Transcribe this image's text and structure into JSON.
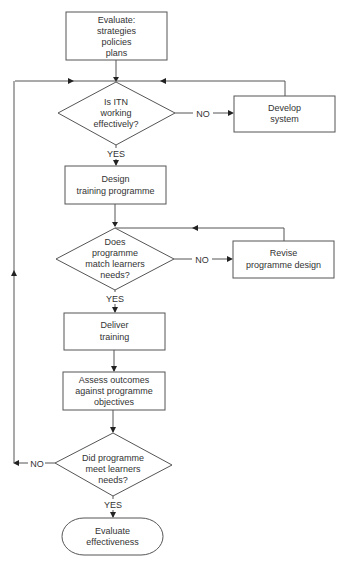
{
  "diagram": {
    "type": "flowchart",
    "colors": {
      "stroke": "#555555",
      "text": "#333333",
      "background": "#ffffff",
      "arrow": "#222222"
    },
    "nodes": {
      "evaluate_strategies": {
        "shape": "rectangle",
        "lines": [
          "Evaluate:",
          "strategies",
          "policies",
          "plans"
        ]
      },
      "itn_decision": {
        "shape": "diamond",
        "lines": [
          "Is ITN",
          "working",
          "effectively?"
        ]
      },
      "develop_system": {
        "shape": "rectangle",
        "lines": [
          "Develop",
          "system"
        ]
      },
      "design_training": {
        "shape": "rectangle",
        "lines": [
          "Design",
          "training programme"
        ]
      },
      "match_decision": {
        "shape": "diamond",
        "lines": [
          "Does",
          "programme",
          "match learners",
          "needs?"
        ]
      },
      "revise_design": {
        "shape": "rectangle",
        "lines": [
          "Revise",
          "programme design"
        ]
      },
      "deliver_training": {
        "shape": "rectangle",
        "lines": [
          "Deliver",
          "training"
        ]
      },
      "assess_outcomes": {
        "shape": "rectangle",
        "lines": [
          "Assess outcomes",
          "against programme",
          "objectives"
        ]
      },
      "meet_decision": {
        "shape": "diamond",
        "lines": [
          "Did programme",
          "meet learners",
          "needs?"
        ]
      },
      "evaluate_effectiveness": {
        "shape": "terminator",
        "lines": [
          "Evaluate",
          "effectiveness"
        ]
      }
    },
    "edges": [
      {
        "from": "evaluate_strategies",
        "to": "itn_decision",
        "label": ""
      },
      {
        "from": "itn_decision",
        "to": "develop_system",
        "label": "NO"
      },
      {
        "from": "develop_system",
        "to": "itn_decision",
        "label": ""
      },
      {
        "from": "itn_decision",
        "to": "design_training",
        "label": "YES"
      },
      {
        "from": "design_training",
        "to": "match_decision",
        "label": ""
      },
      {
        "from": "match_decision",
        "to": "revise_design",
        "label": "NO"
      },
      {
        "from": "revise_design",
        "to": "match_decision",
        "label": ""
      },
      {
        "from": "match_decision",
        "to": "deliver_training",
        "label": "YES"
      },
      {
        "from": "deliver_training",
        "to": "assess_outcomes",
        "label": ""
      },
      {
        "from": "assess_outcomes",
        "to": "meet_decision",
        "label": ""
      },
      {
        "from": "meet_decision",
        "to": "itn_decision",
        "label": "NO"
      },
      {
        "from": "meet_decision",
        "to": "evaluate_effectiveness",
        "label": "YES"
      }
    ],
    "labels": {
      "itn_no": "NO",
      "itn_yes": "YES",
      "match_no": "NO",
      "match_yes": "YES",
      "meet_no": "NO",
      "meet_yes": "YES"
    }
  }
}
